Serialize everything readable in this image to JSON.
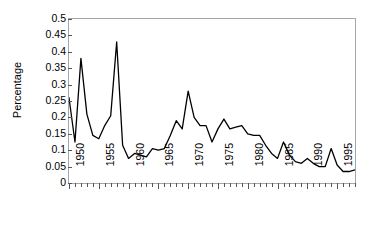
{
  "chart_data": {
    "type": "line",
    "title": "",
    "subtitle": "",
    "xlabel": "",
    "ylabel": "Percentage",
    "xlim": [
      1950,
      1998
    ],
    "ylim": [
      0,
      0.5
    ],
    "grid": false,
    "legend": null,
    "y_ticks": [
      0,
      0.05,
      0.1,
      0.15,
      0.2,
      0.25,
      0.3,
      0.35,
      0.4,
      0.45,
      0.5
    ],
    "y_tick_labels": [
      "0",
      "0.05",
      "0.1",
      "0.15",
      "0.2",
      "0.25",
      "0.3",
      "0.35",
      "0.4",
      "0.45",
      "0.5"
    ],
    "x_tick_labels": [
      "1950",
      "1955",
      "1960",
      "1965",
      "1970",
      "1975",
      "1980",
      "1985",
      "1990",
      "1995"
    ],
    "x_tick_label_values": [
      1950,
      1955,
      1960,
      1965,
      1970,
      1975,
      1980,
      1985,
      1990,
      1995
    ],
    "x_minor_tick_step": 1,
    "line_color": "#000000",
    "line_width": 1.3,
    "frame_color": "#a6a6a6",
    "x": [
      1950,
      1951,
      1952,
      1953,
      1954,
      1955,
      1956,
      1957,
      1958,
      1959,
      1960,
      1961,
      1962,
      1963,
      1964,
      1965,
      1966,
      1967,
      1968,
      1969,
      1970,
      1971,
      1972,
      1973,
      1974,
      1975,
      1976,
      1977,
      1978,
      1979,
      1980,
      1981,
      1982,
      1983,
      1984,
      1985,
      1986,
      1987,
      1988,
      1989,
      1990,
      1991,
      1992,
      1993,
      1994,
      1995,
      1996,
      1997,
      1998
    ],
    "values": [
      0.26,
      0.125,
      0.38,
      0.21,
      0.145,
      0.135,
      0.175,
      0.205,
      0.43,
      0.115,
      0.075,
      0.09,
      0.085,
      0.08,
      0.105,
      0.1,
      0.105,
      0.145,
      0.19,
      0.165,
      0.28,
      0.2,
      0.175,
      0.175,
      0.125,
      0.165,
      0.195,
      0.165,
      0.17,
      0.175,
      0.15,
      0.145,
      0.145,
      0.115,
      0.09,
      0.075,
      0.125,
      0.085,
      0.065,
      0.06,
      0.075,
      0.06,
      0.05,
      0.05,
      0.105,
      0.055,
      0.035,
      0.035,
      0.04
    ]
  }
}
